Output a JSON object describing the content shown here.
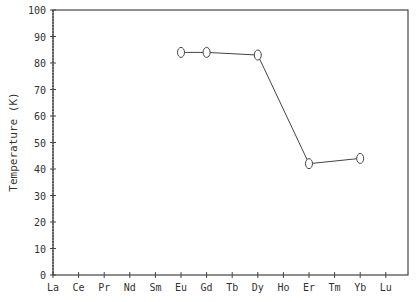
{
  "chart_data": {
    "type": "line",
    "title": "",
    "xlabel": "",
    "ylabel": "Temperature (K)",
    "categories": [
      "La",
      "Ce",
      "Pr",
      "Nd",
      "Sm",
      "Eu",
      "Gd",
      "Tb",
      "Dy",
      "Ho",
      "Er",
      "Tm",
      "Yb",
      "Lu"
    ],
    "ylim": [
      0,
      100
    ],
    "yticks": [
      0,
      10,
      20,
      30,
      40,
      50,
      60,
      70,
      80,
      90,
      100
    ],
    "grid": false,
    "legend": null,
    "series": [
      {
        "name": "Temperature",
        "points": [
          {
            "x": "Eu",
            "y": 84
          },
          {
            "x": "Gd",
            "y": 84
          },
          {
            "x": "Dy",
            "y": 83
          },
          {
            "x": "Er",
            "y": 42
          },
          {
            "x": "Yb",
            "y": 44
          }
        ],
        "marker": "open-ellipse"
      }
    ]
  }
}
